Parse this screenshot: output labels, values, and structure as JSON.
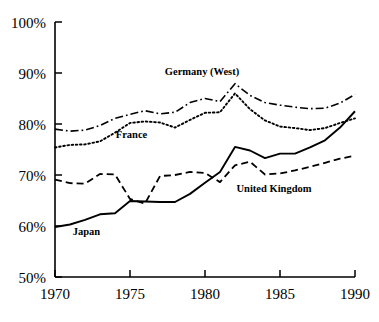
{
  "chart_data": {
    "type": "line",
    "title": "",
    "subtitle": "",
    "xlabel": "",
    "ylabel": "",
    "xlim": [
      1970,
      1990
    ],
    "ylim": [
      50,
      100
    ],
    "grid": false,
    "legend_position": "inline-annotations",
    "y_tick_format": "percent",
    "x_ticks": [
      1970,
      1975,
      1980,
      1985,
      1990
    ],
    "x_tick_labels": [
      "1970",
      "1975",
      "1980",
      "1985",
      "1990"
    ],
    "y_ticks": [
      50,
      60,
      70,
      80,
      90,
      100
    ],
    "y_tick_labels": [
      "50%",
      "60%",
      "70%",
      "80%",
      "90%",
      "100%"
    ],
    "x": [
      1970,
      1971,
      1972,
      1973,
      1974,
      1975,
      1976,
      1977,
      1978,
      1979,
      1980,
      1981,
      1982,
      1983,
      1984,
      1985,
      1986,
      1987,
      1988,
      1989,
      1990
    ],
    "series": [
      {
        "name": "Japan",
        "style": "solid",
        "label": "Japan",
        "label_x": 1972.1,
        "label_y": 58.2,
        "values": [
          59.8,
          60.3,
          61.2,
          62.3,
          62.5,
          64.9,
          64.8,
          64.7,
          64.7,
          66.3,
          68.5,
          70.6,
          75.5,
          74.8,
          73.3,
          74.2,
          74.2,
          75.4,
          76.8,
          79.3,
          82.5
        ]
      },
      {
        "name": "United Kingdom",
        "style": "dashed",
        "label": "United Kingdom",
        "label_x": 1984.6,
        "label_y": 66.6,
        "values": [
          69.1,
          68.4,
          68.3,
          70.2,
          70.1,
          65.3,
          64.4,
          69.8,
          70.0,
          70.6,
          70.4,
          68.6,
          71.9,
          72.6,
          70.1,
          70.3,
          70.9,
          71.6,
          72.4,
          73.2,
          73.8
        ]
      },
      {
        "name": "France",
        "style": "dotted",
        "label": "France",
        "label_x": 1975.1,
        "label_y": 77.3,
        "values": [
          75.4,
          75.9,
          76.0,
          76.6,
          78.3,
          80.2,
          80.5,
          80.3,
          79.3,
          80.8,
          82.2,
          82.3,
          86.0,
          82.9,
          80.7,
          79.5,
          79.2,
          78.8,
          79.2,
          80.2,
          81.1
        ]
      },
      {
        "name": "Germany (West)",
        "style": "dashdot",
        "label": "Germany (West)",
        "label_x": 1979.8,
        "label_y": 89.6,
        "values": [
          79.0,
          78.6,
          78.8,
          79.7,
          81.1,
          81.9,
          82.6,
          82.0,
          82.3,
          84.2,
          85.0,
          84.4,
          87.9,
          85.6,
          84.2,
          83.7,
          83.3,
          83.0,
          83.1,
          84.1,
          85.8
        ]
      }
    ]
  },
  "style": {
    "axis_color": "#000000",
    "line_color": "#000000",
    "background": "#ffffff"
  }
}
